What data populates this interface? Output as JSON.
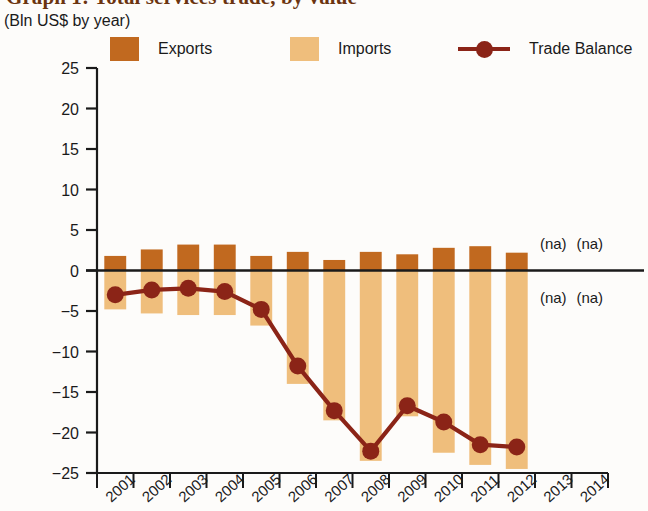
{
  "chart_data": {
    "type": "bar",
    "title": "Graph 1: Total services trade, by value",
    "subtitle": "(Bln US$ by year)",
    "xlabel": "",
    "ylabel": "",
    "ylim": [
      -25,
      25
    ],
    "ytick_step": 5,
    "grid": false,
    "legend_position": "top",
    "categories": [
      "2001",
      "2002",
      "2003",
      "2004",
      "2005",
      "2006",
      "2007",
      "2008",
      "2009",
      "2010",
      "2011",
      "2012",
      "2013",
      "2014"
    ],
    "yticks": [
      "25",
      "20",
      "15",
      "10",
      "5",
      "0",
      "−5",
      "−10",
      "−15",
      "−20",
      "−25"
    ],
    "series": [
      {
        "name": "Exports",
        "type": "bar",
        "color": "#C1691F",
        "values": [
          1.8,
          2.6,
          3.2,
          3.2,
          1.8,
          2.3,
          1.3,
          2.3,
          2.0,
          2.8,
          3.0,
          2.2,
          null,
          null
        ]
      },
      {
        "name": "Imports",
        "type": "bar",
        "color": "#EFBE7C",
        "values": [
          -4.8,
          -5.3,
          -5.5,
          -5.5,
          -6.8,
          -14.0,
          -18.5,
          -23.5,
          -18.0,
          -22.5,
          -24.0,
          -24.5,
          null,
          null
        ]
      },
      {
        "name": "Trade Balance",
        "type": "line",
        "color": "#8B2417",
        "values": [
          -3.0,
          -2.4,
          -2.2,
          -2.6,
          -4.8,
          -11.8,
          -17.3,
          -22.3,
          -16.7,
          -18.7,
          -21.5,
          -21.8,
          null,
          null
        ]
      }
    ],
    "annotations": [
      {
        "text": "(na)",
        "category": "2013",
        "position": "above-axis"
      },
      {
        "text": "(na)",
        "category": "2014",
        "position": "above-axis"
      },
      {
        "text": "(na)",
        "category": "2013",
        "position": "below-axis"
      },
      {
        "text": "(na)",
        "category": "2014",
        "position": "below-axis"
      }
    ]
  },
  "legend": {
    "exports_label": "Exports",
    "imports_label": "Imports",
    "balance_label": "Trade Balance"
  },
  "colors": {
    "exports": "#C1691F",
    "imports": "#EFBE7C",
    "balance": "#8B2417",
    "axis": "#1a1a1a",
    "title": "#6b3410"
  }
}
